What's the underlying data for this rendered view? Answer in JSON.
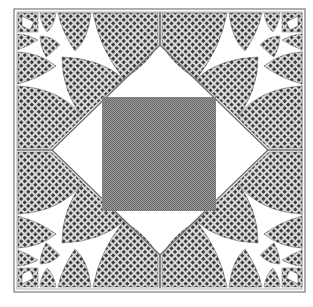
{
  "figure": {
    "colors": {
      "background": "#ffffff",
      "frame": "#7a7a7a",
      "center_square": "#8a8a8a",
      "lace_dark": "#3a3a3a",
      "lace_light": "#d8d8d8",
      "lines": "#6e6e6e"
    },
    "frame": {
      "x": 14,
      "y": 9,
      "width": 291,
      "height": 283
    },
    "center_square": {
      "x": 102,
      "y": 97,
      "width": 114,
      "height": 114
    },
    "diamond": {
      "top": [
        160,
        45
      ],
      "right": [
        268,
        150
      ],
      "bottom": [
        160,
        255
      ],
      "left": [
        52,
        150
      ]
    },
    "symmetry": "4-fold mirror"
  }
}
